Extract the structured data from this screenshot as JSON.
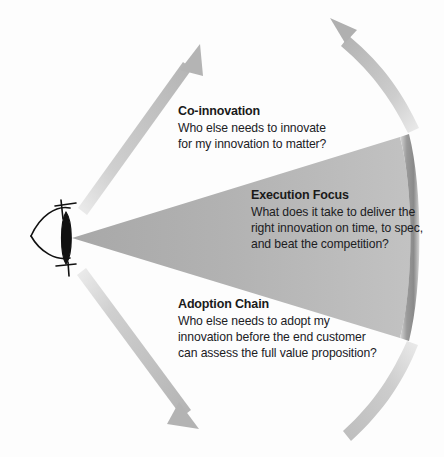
{
  "diagram": {
    "viewer_icon": "eye-icon",
    "background_color": "#fdfdfd",
    "cone": {
      "name": "execution-focus-cone",
      "fill_color": "#b5b5b5",
      "edge_band_color": "#8f8f8f"
    },
    "arrows": {
      "color": "#b9b9b9",
      "items": [
        {
          "name": "co-innovation-arrow",
          "direction": "up-right",
          "style": "straight"
        },
        {
          "name": "co-innovation-outer-arc",
          "direction": "up-left",
          "style": "curved"
        },
        {
          "name": "adoption-chain-arrow",
          "direction": "down-right",
          "style": "straight"
        },
        {
          "name": "adoption-chain-outer-arc",
          "direction": "down-left",
          "style": "curved"
        }
      ]
    },
    "blocks": [
      {
        "id": "co-innovation",
        "title": "Co-innovation",
        "lines": [
          "Who else needs to innovate",
          "for my innovation to matter?"
        ]
      },
      {
        "id": "execution-focus",
        "title": "Execution Focus",
        "lines": [
          "What does it take to deliver the",
          "right innovation on time, to spec,",
          "and beat the competition?"
        ]
      },
      {
        "id": "adoption-chain",
        "title": "Adoption Chain",
        "lines": [
          "Who else needs to adopt my",
          "innovation before the end customer",
          "can assess the full value proposition?"
        ]
      }
    ]
  }
}
